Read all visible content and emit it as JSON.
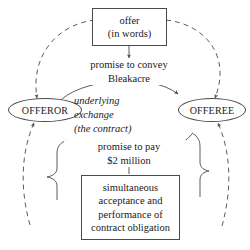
{
  "diagram": {
    "background_color": "#ffffff",
    "line_color": "#4a4a4a",
    "text_color": "#1a1a1a",
    "nodes": [
      {
        "id": "offer",
        "shape": "rectangle",
        "lines": [
          "offer",
          "(in words)"
        ]
      },
      {
        "id": "offeror",
        "shape": "rounded-oval",
        "label": "OFFEROR"
      },
      {
        "id": "offeree",
        "shape": "rounded-oval",
        "label": "OFFEREE"
      },
      {
        "id": "acceptance",
        "shape": "rectangle",
        "lines": [
          "simultaneous",
          "acceptance and",
          "performance of",
          "contract obligation"
        ]
      }
    ],
    "edge_labels": [
      {
        "id": "promise-to-convey",
        "style": "roman",
        "lines": [
          "promise to convey",
          "Bleakacre"
        ]
      },
      {
        "id": "underlying-exchange",
        "style": "italic",
        "lines": [
          "underlying",
          "exchange",
          "(the contract)"
        ]
      },
      {
        "id": "promise-to-pay",
        "style": "roman",
        "lines": [
          "promise to pay",
          "$2 million"
        ]
      }
    ],
    "edges": [
      {
        "id": "offer-to-convey",
        "type": "solid-arrow",
        "from": "offer",
        "to": "promise-to-convey"
      },
      {
        "id": "offeror-to-offeree",
        "type": "solid-arrow",
        "from": "offeror",
        "to": "offeree"
      },
      {
        "id": "offeree-to-offeror",
        "type": "solid-arrow",
        "from": "offeree",
        "to": "offeror"
      },
      {
        "id": "acceptance-to-pay",
        "type": "solid-arrow",
        "from": "acceptance",
        "to": "promise-to-pay"
      },
      {
        "id": "offer-to-offeror-dashed",
        "type": "dashed-arrow",
        "from": "offer",
        "to": "offeror"
      },
      {
        "id": "offer-to-offeree-dashed",
        "type": "dashed-arrow",
        "from": "offer",
        "to": "offeree"
      },
      {
        "id": "acceptance-to-offeror-dashed",
        "type": "dashed-arrow",
        "from": "acceptance",
        "to": "offeror"
      },
      {
        "id": "acceptance-to-offeree-dashed",
        "type": "dashed-arrow",
        "from": "acceptance",
        "to": "offeree"
      }
    ]
  }
}
